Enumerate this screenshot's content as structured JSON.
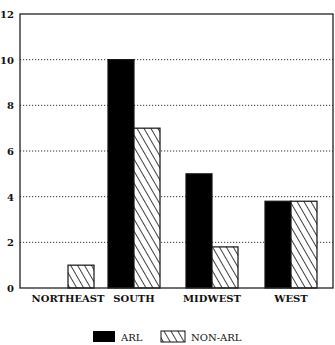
{
  "chart_data": {
    "type": "bar",
    "title": "",
    "xlabel": "",
    "ylabel": "",
    "categories": [
      "NORTHEAST",
      "SOUTH",
      "MIDWEST",
      "WEST"
    ],
    "series": [
      {
        "name": "ARL",
        "pattern": "solid",
        "color": "#000000",
        "values": [
          0,
          10,
          5,
          3.8
        ]
      },
      {
        "name": "NON-ARL",
        "pattern": "diagonal-hatch",
        "color": "#ffffff",
        "values": [
          1,
          7,
          1.8,
          3.8
        ]
      }
    ],
    "ylim": [
      0,
      12
    ],
    "yticks": [
      0,
      2,
      4,
      6,
      8,
      10,
      12
    ],
    "grid": "horizontal dotted",
    "legend_position": "bottom-center"
  },
  "legend": {
    "items": [
      {
        "label": "ARL"
      },
      {
        "label": "NON-ARL"
      }
    ]
  }
}
